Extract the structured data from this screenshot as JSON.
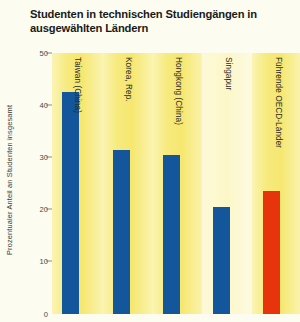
{
  "chart_data": {
    "type": "bar",
    "title": "Studenten in technischen Studiengängen in ausgewählten Ländern",
    "xlabel": "",
    "ylabel": "Prozentualer Anteil an Studenten insgesamt",
    "ylim": [
      0,
      50
    ],
    "yticks": [
      0,
      10,
      20,
      30,
      40,
      50
    ],
    "ytick_labels": [
      "0",
      "10",
      "20",
      "30",
      "40",
      "50"
    ],
    "grid": false,
    "legend": "none",
    "categories": [
      "Taiwan (China)",
      "Korea, Rep.",
      "Hongkong (China)",
      "Singapur",
      "Führende OECD-Länder"
    ],
    "values": [
      42.5,
      31.5,
      30.5,
      20.5,
      23.5
    ],
    "bar_colors": [
      "#14569b",
      "#14569b",
      "#14569b",
      "#14569b",
      "#e8340c"
    ],
    "colors": {
      "bar_primary": "#14569b",
      "bar_accent": "#e8340c",
      "band_yellow": "#f6e770",
      "band_pale": "#fcf7c8",
      "page_background": "#fcfcf0",
      "text": "#1a1a1a"
    }
  }
}
